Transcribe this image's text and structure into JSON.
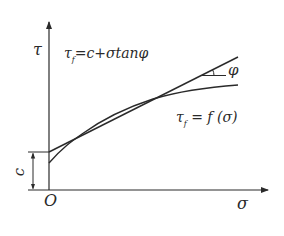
{
  "diagram": {
    "type": "mohr-coulomb-strength-envelope",
    "axes": {
      "y_label": "τ",
      "x_label": "σ",
      "origin_label": "O"
    },
    "linear_envelope": {
      "main": "τ",
      "sub": "f",
      "rhs": "=c+σtanφ"
    },
    "curved_envelope": {
      "main": "τ",
      "sub": "f",
      "rhs": " = f (σ)"
    },
    "intercept_label": "c",
    "angle_label": "φ",
    "colors": {
      "line": "#2a2a2a",
      "background": "#ffffff"
    }
  }
}
